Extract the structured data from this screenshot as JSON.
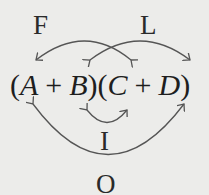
{
  "diagram": {
    "labels": {
      "first": "F",
      "last": "L",
      "inner": "I",
      "outer": "O"
    },
    "expression": {
      "open1": "(",
      "a": "A",
      "plus1": "+",
      "b": "B",
      "close1": ")",
      "open2": "(",
      "c": "C",
      "plus2": "+",
      "d": "D",
      "close2": ")"
    },
    "arrows": [
      {
        "name": "first",
        "from": "A",
        "to": "C",
        "side": "top"
      },
      {
        "name": "last",
        "from": "B",
        "to": "D",
        "side": "top"
      },
      {
        "name": "inner",
        "from": "B",
        "to": "C",
        "side": "bottom"
      },
      {
        "name": "outer",
        "from": "A",
        "to": "D",
        "side": "bottom"
      }
    ],
    "colors": {
      "background": "#ececea",
      "stroke": "#555555",
      "text": "#222222"
    }
  }
}
